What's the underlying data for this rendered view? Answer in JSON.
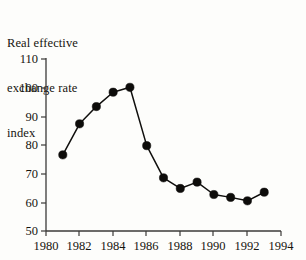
{
  "title": {
    "line1": "Real effective",
    "line2": "exchange rate",
    "line3": "index"
  },
  "axes": {
    "y_ticks": [
      "110",
      "100",
      "90",
      "80",
      "70",
      "60",
      "50"
    ],
    "x_ticks": [
      "1980",
      "1982",
      "1984",
      "1986",
      "1988",
      "1990",
      "1992",
      "1994"
    ]
  },
  "chart_data": {
    "type": "line",
    "title": "Real effective exchange rate index",
    "xlabel": "",
    "ylabel": "Real effective exchange rate index",
    "x": [
      1981,
      1982,
      1983,
      1984,
      1985,
      1986,
      1987,
      1988,
      1989,
      1990,
      1991,
      1992,
      1993
    ],
    "values": [
      76.5,
      87.3,
      93.3,
      98.3,
      100.0,
      79.7,
      68.5,
      64.8,
      67.0,
      62.7,
      61.7,
      60.5,
      63.5
    ],
    "series": [
      {
        "name": "Real effective exchange rate index",
        "values": [
          76.5,
          87.3,
          93.3,
          98.3,
          100.0,
          79.7,
          68.5,
          64.8,
          67.0,
          62.7,
          61.7,
          60.5,
          63.5
        ]
      }
    ],
    "xlim": [
      1980,
      1994
    ],
    "ylim": [
      50,
      110
    ],
    "y_tick_values": [
      50,
      60,
      70,
      80,
      90,
      100,
      110
    ],
    "x_tick_values": [
      1980,
      1982,
      1984,
      1986,
      1988,
      1990,
      1992,
      1994
    ],
    "grid": false,
    "legend": "none",
    "marker": "filled-circle",
    "line_color": "#100f0d",
    "marker_color": "#0d0c0a",
    "background_color": "#fdfdfb"
  }
}
